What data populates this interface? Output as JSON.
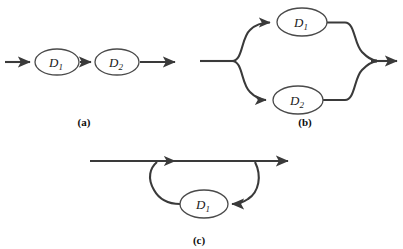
{
  "figure": {
    "background_color": "#ffffff",
    "line_color": "#3a3a3a",
    "node_fill_color": "#ffffff",
    "node_stroke_color": "#4a4a4a",
    "label_color": "#1a1a1a"
  },
  "panels": [
    {
      "id": "a",
      "caption": "(a)",
      "configuration": "series",
      "nodes": [
        {
          "id": "a-d1",
          "label_base": "D",
          "label_sub": "1",
          "cx": 57,
          "cy": 62,
          "rx": 22,
          "ry": 13
        },
        {
          "id": "a-d2",
          "label_base": "D",
          "label_sub": "2",
          "cx": 117,
          "cy": 62,
          "rx": 22,
          "ry": 13
        }
      ],
      "edges": [
        {
          "id": "a-in",
          "from": "input",
          "to": "a-d1",
          "arrow": true
        },
        {
          "id": "a-mid",
          "from": "a-d1",
          "to": "a-d2",
          "arrow": true
        },
        {
          "id": "a-out",
          "from": "a-d2",
          "to": "output",
          "arrow": true
        }
      ]
    },
    {
      "id": "b",
      "caption": "(b)",
      "configuration": "parallel",
      "nodes": [
        {
          "id": "b-d1",
          "label_base": "D",
          "label_sub": "1",
          "cx": 302,
          "cy": 22,
          "rx": 25,
          "ry": 14
        },
        {
          "id": "b-d2",
          "label_base": "D",
          "label_sub": "2",
          "cx": 298,
          "cy": 100,
          "rx": 25,
          "ry": 14
        }
      ],
      "edges": [
        {
          "id": "b-in",
          "from": "input",
          "to": "split",
          "arrow": false
        },
        {
          "id": "b-split-top",
          "from": "split",
          "to": "b-d1",
          "arrow": true
        },
        {
          "id": "b-split-bottom",
          "from": "split",
          "to": "b-d2",
          "arrow": true
        },
        {
          "id": "b-top-merge",
          "from": "b-d1",
          "to": "merge",
          "arrow": false
        },
        {
          "id": "b-bottom-merge",
          "from": "b-d2",
          "to": "merge",
          "arrow": false
        },
        {
          "id": "b-out",
          "from": "merge",
          "to": "output",
          "arrow": true
        }
      ]
    },
    {
      "id": "c",
      "caption": "(c)",
      "configuration": "feedback-loop",
      "nodes": [
        {
          "id": "c-d1",
          "label_base": "D",
          "label_sub": "1",
          "cx": 204,
          "cy": 204,
          "rx": 24,
          "ry": 14
        }
      ],
      "edges": [
        {
          "id": "c-main",
          "from": "input",
          "to": "output",
          "arrow": true
        },
        {
          "id": "c-loop-down",
          "from": "main-line",
          "to": "c-d1",
          "arrow": true
        },
        {
          "id": "c-loop-back",
          "from": "c-d1",
          "to": "main-line",
          "arrow": true
        }
      ]
    }
  ]
}
